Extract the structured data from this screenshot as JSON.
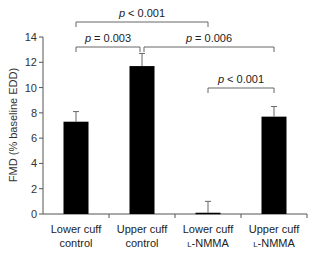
{
  "chart_data": {
    "type": "bar",
    "title": "",
    "xlabel": "",
    "ylabel": "FMD (% baseline EDD)",
    "ylim": [
      0,
      14
    ],
    "yticks": [
      0,
      2,
      4,
      6,
      8,
      10,
      12,
      14
    ],
    "grid": false,
    "legend": null,
    "categories": [
      {
        "line1": "Lower cuff",
        "line2": "control",
        "line2_prefix": ""
      },
      {
        "line1": "Upper cuff",
        "line2": "control",
        "line2_prefix": ""
      },
      {
        "line1": "Lower cuff",
        "line2": "-NMMA",
        "line2_prefix": "L"
      },
      {
        "line1": "Upper cuff",
        "line2": "-NMMA",
        "line2_prefix": "L"
      }
    ],
    "values": [
      7.3,
      11.7,
      0.1,
      7.7
    ],
    "error_upper": [
      8.1,
      12.7,
      1.0,
      8.5
    ],
    "bar_color": "#000000",
    "annotations": [
      {
        "text_p": "p",
        "text_rest": " < 0.001",
        "from": 0,
        "to": 2,
        "level": 1
      },
      {
        "text_p": "p",
        "text_rest": " = 0.003",
        "from": 0,
        "to": 1,
        "level": 2
      },
      {
        "text_p": "p",
        "text_rest": " = 0.006",
        "from": 1,
        "to": 3,
        "level": 2
      },
      {
        "text_p": "p",
        "text_rest": " < 0.001",
        "from": 2,
        "to": 3,
        "level": 3
      }
    ]
  }
}
